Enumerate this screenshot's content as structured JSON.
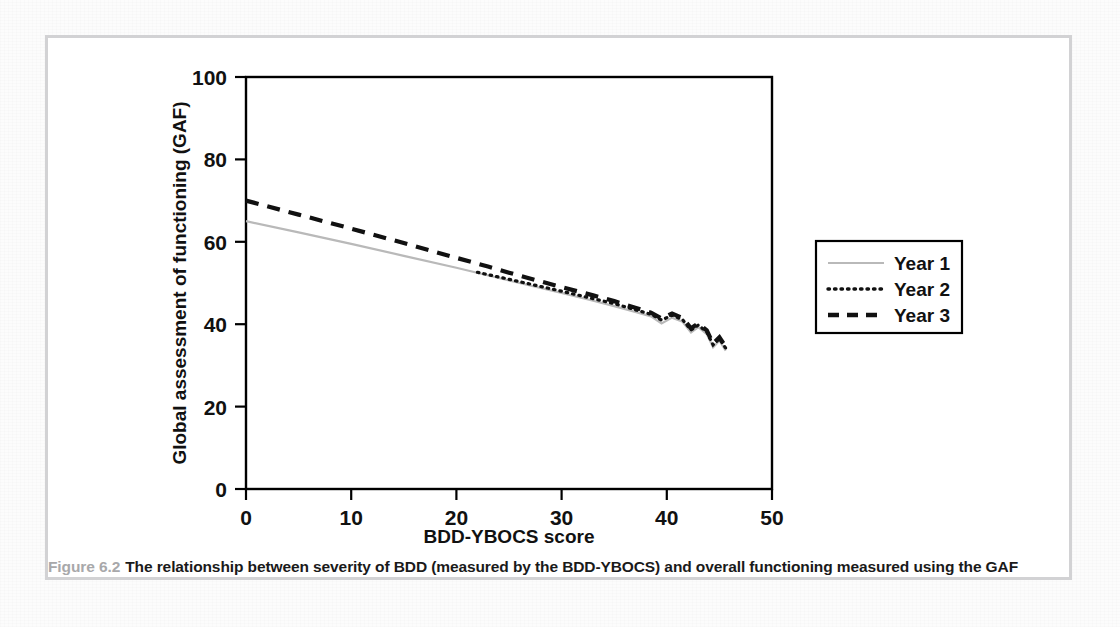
{
  "figure": {
    "number": "Figure 6.2",
    "caption": "The relationship between severity of BDD (measured by the BDD-YBOCS) and overall functioning measured using the GAF"
  },
  "colors": {
    "year1_line": "#b9b9b9",
    "year2_line": "#111111",
    "year3_line": "#111111",
    "frame_border": "#d2d2d4",
    "axis": "#000000",
    "caption_number": "#a8a8aa"
  },
  "chart_data": {
    "type": "line",
    "title": "",
    "xlabel": "BDD-YBOCS score",
    "ylabel": "Global assessment of functioning (GAF)",
    "xlim": [
      0,
      50
    ],
    "ylim": [
      0,
      100
    ],
    "xticks": [
      0,
      10,
      20,
      30,
      40,
      50
    ],
    "yticks": [
      0,
      20,
      40,
      60,
      80,
      100
    ],
    "xtick_labels": [
      "0",
      "10",
      "20",
      "30",
      "40",
      "50"
    ],
    "ytick_labels": [
      "0",
      "20",
      "40",
      "60",
      "80",
      "100"
    ],
    "grid": false,
    "legend_position": "right-outside",
    "series": [
      {
        "name": "Year 1",
        "style": "solid",
        "color": "#b9b9b9",
        "points": [
          [
            0,
            65.0
          ],
          [
            5,
            62.3
          ],
          [
            10,
            59.5
          ],
          [
            15,
            56.6
          ],
          [
            20,
            53.7
          ],
          [
            25,
            50.6
          ],
          [
            30,
            47.6
          ],
          [
            33,
            45.7
          ],
          [
            35,
            44.4
          ],
          [
            37,
            43.0
          ],
          [
            38.5,
            41.9
          ],
          [
            39.5,
            40.2
          ],
          [
            40.5,
            41.6
          ],
          [
            41.5,
            40.6
          ],
          [
            42.3,
            38.0
          ],
          [
            43.0,
            39.3
          ],
          [
            43.8,
            37.6
          ],
          [
            44.4,
            34.4
          ],
          [
            45.0,
            36.0
          ],
          [
            45.6,
            33.6
          ]
        ]
      },
      {
        "name": "Year 2",
        "style": "dotted",
        "color": "#111111",
        "points": [
          [
            22,
            52.6
          ],
          [
            25,
            50.9
          ],
          [
            30,
            48.0
          ],
          [
            33,
            46.2
          ],
          [
            35,
            45.0
          ],
          [
            37,
            43.5
          ],
          [
            38.5,
            42.4
          ],
          [
            39.5,
            41.0
          ],
          [
            40.5,
            42.2
          ],
          [
            41.5,
            41.1
          ],
          [
            42.3,
            38.6
          ],
          [
            43.0,
            39.8
          ],
          [
            43.8,
            38.1
          ],
          [
            44.4,
            35.0
          ],
          [
            45.0,
            36.5
          ],
          [
            45.6,
            34.2
          ]
        ]
      },
      {
        "name": "Year 3",
        "style": "dashed",
        "color": "#111111",
        "points": [
          [
            0,
            70.0
          ],
          [
            5,
            66.6
          ],
          [
            10,
            63.2
          ],
          [
            15,
            59.7
          ],
          [
            20,
            56.1
          ],
          [
            23,
            54.0
          ],
          [
            25,
            52.5
          ],
          [
            30,
            49.0
          ],
          [
            33,
            47.0
          ],
          [
            35,
            45.6
          ],
          [
            37,
            44.0
          ],
          [
            38.5,
            42.8
          ],
          [
            39.5,
            41.4
          ],
          [
            40.5,
            42.6
          ],
          [
            41.5,
            41.5
          ],
          [
            42.3,
            39.0
          ],
          [
            43.0,
            40.2
          ],
          [
            43.8,
            38.5
          ],
          [
            44.4,
            35.3
          ],
          [
            45.0,
            36.8
          ],
          [
            45.6,
            34.5
          ]
        ]
      }
    ],
    "legend": [
      {
        "label": "Year 1",
        "style": "solid",
        "color": "#b9b9b9"
      },
      {
        "label": "Year 2",
        "style": "dotted",
        "color": "#111111"
      },
      {
        "label": "Year 3",
        "style": "dashed",
        "color": "#111111"
      }
    ]
  }
}
